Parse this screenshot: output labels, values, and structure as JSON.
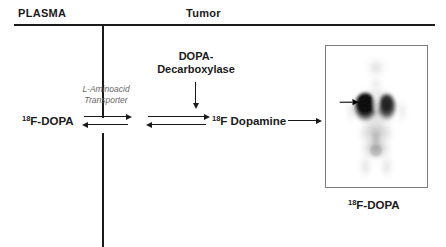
{
  "figure": {
    "type": "biochemical-pathway-diagram",
    "compartments": [
      {
        "id": "plasma",
        "label": "PLASMA"
      },
      {
        "id": "tumor",
        "label": "Tumor"
      }
    ],
    "species": {
      "plasma_tracer": {
        "superscript": "18",
        "text": "F-DOPA"
      },
      "tumor_metabolite": {
        "superscript": "18",
        "text": "F Dopamine"
      }
    },
    "enzyme": {
      "line1": "DOPA-",
      "line2": "Decarboxylase"
    },
    "transporter": {
      "line1": "L-Aminoacid",
      "line2": "Transporter"
    },
    "image_panel": {
      "modality": "PET",
      "caption_superscript": "18",
      "caption_text": "F-DOPA",
      "annotation": "arrow-marker-lesion"
    },
    "arrows": {
      "membrane_transport": "bidirectional-equilibrium",
      "decarboxylation": "bidirectional-equilibrium",
      "enzyme_action": "downward",
      "imaging_readout": "rightward"
    },
    "colors": {
      "ink": "#1a1a1a",
      "muted_text": "#666666",
      "frame": "#7a7a7a",
      "background": "#ffffff"
    }
  }
}
